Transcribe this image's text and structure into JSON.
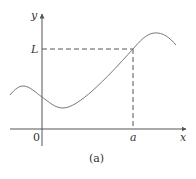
{
  "figure": {
    "caption": "(a)",
    "axes": {
      "x_label": "x",
      "y_label": "y",
      "origin_label": "0"
    },
    "markers": {
      "x_marker_label": "a",
      "y_marker_label": "L"
    },
    "colors": {
      "axis": "#555555",
      "curve": "#777777",
      "dashed": "#555555",
      "text": "#333333"
    }
  }
}
